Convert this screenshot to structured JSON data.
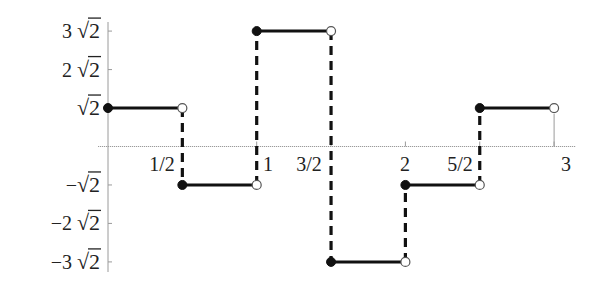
{
  "chart_data": {
    "type": "line",
    "subtype": "step",
    "title": "",
    "xlabel": "",
    "ylabel": "",
    "xlim": [
      0,
      3
    ],
    "ylim": [
      -4.243,
      4.243
    ],
    "grid": false,
    "legend": null,
    "x_ticks": [
      {
        "value": 0.5,
        "label": "1/2"
      },
      {
        "value": 1,
        "label": "1"
      },
      {
        "value": 1.5,
        "label": "3/2"
      },
      {
        "value": 2,
        "label": "2"
      },
      {
        "value": 2.5,
        "label": "5/2"
      },
      {
        "value": 3,
        "label": "3"
      }
    ],
    "y_ticks": [
      {
        "value": 4.243,
        "label": "3 √2",
        "coef": "3 "
      },
      {
        "value": 2.828,
        "label": "2 √2",
        "coef": "2 "
      },
      {
        "value": 1.414,
        "label": "√2",
        "coef": ""
      },
      {
        "value": -1.414,
        "label": "−√2",
        "coef": "−"
      },
      {
        "value": -2.828,
        "label": "−2 √2",
        "coef": "−2 "
      },
      {
        "value": -4.243,
        "label": "−3 √2",
        "coef": "−3 "
      }
    ],
    "segments": [
      {
        "x_start": 0,
        "x_end": 0.5,
        "y": 1.414,
        "y_label": "√2"
      },
      {
        "x_start": 0.5,
        "x_end": 1,
        "y": -1.414,
        "y_label": "−√2"
      },
      {
        "x_start": 1,
        "x_end": 1.5,
        "y": 4.243,
        "y_label": "3√2"
      },
      {
        "x_start": 1.5,
        "x_end": 2,
        "y": -4.243,
        "y_label": "−3√2"
      },
      {
        "x_start": 2,
        "x_end": 2.5,
        "y": -1.414,
        "y_label": "−√2"
      },
      {
        "x_start": 2.5,
        "x_end": 3,
        "y": 1.414,
        "y_label": "√2"
      }
    ],
    "markers": {
      "start": "filled-circle",
      "end": "open-circle"
    },
    "jump_lines": "dashed-vertical"
  }
}
